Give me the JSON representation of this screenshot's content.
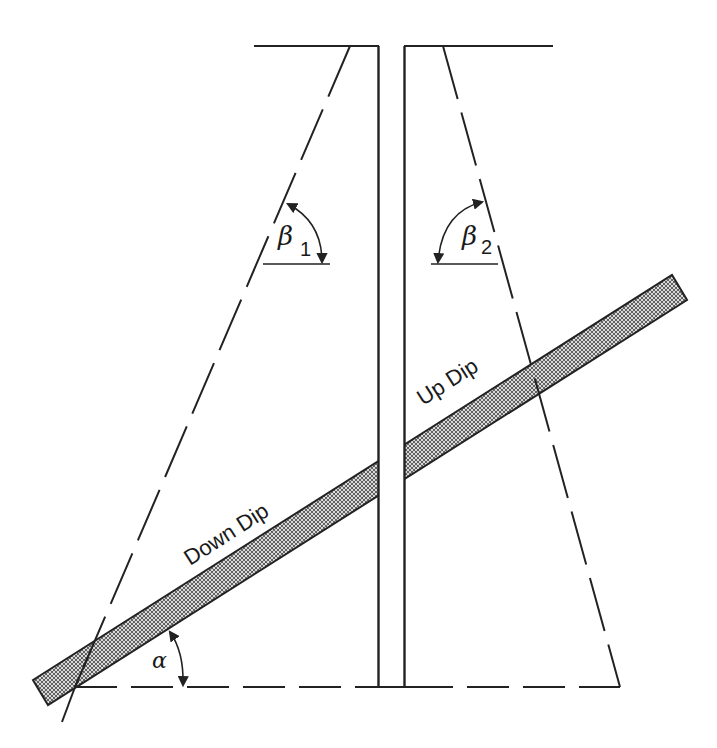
{
  "figure": {
    "colors": {
      "line": "#222222",
      "bed_fill": "#8a8a8a",
      "background": "#ffffff"
    }
  },
  "labels": {
    "down_dip": "Down Dip",
    "up_dip": "Up Dip",
    "beta1_symbol": "β",
    "beta1_sub": "1",
    "beta2_symbol": "β",
    "beta2_sub": "2",
    "alpha_symbol": "α"
  },
  "elements": {
    "wellbore": "vertical borehole (two parallel walls)",
    "bed": "dipping hatched formation bed",
    "reference_line": "horizontal dashed datum",
    "left_ray": "dashed line, down-dip side",
    "right_ray": "dashed line, up-dip side"
  }
}
